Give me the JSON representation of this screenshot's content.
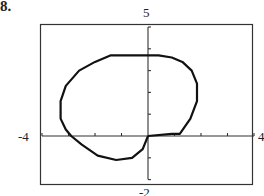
{
  "problem": {
    "number": "8."
  },
  "chart_data": {
    "type": "line",
    "title": "",
    "xlabel": "",
    "ylabel": "",
    "xlim": [
      -4,
      4
    ],
    "ylim": [
      -2,
      5
    ],
    "x_tick_step": 1,
    "y_tick_step": 1,
    "grid": false,
    "legend": null,
    "window_labels": {
      "xmin": "-4",
      "xmax": "4",
      "ymin": "-2",
      "ymax": "5"
    },
    "series": [
      {
        "name": "closed curve (polar graph, cusp near origin)",
        "x": [
          0,
          0.9,
          1.2,
          1.6,
          1.85,
          1.85,
          1.65,
          1.3,
          0.9,
          0.4,
          0,
          -0.5,
          -1.4,
          -2.0,
          -2.6,
          -3.1,
          -3.3,
          -3.3,
          -3.1,
          -2.9,
          -2.5,
          -1.9,
          -1.2,
          -0.6,
          -0.2,
          0
        ],
        "y": [
          0,
          0.1,
          0.1,
          0.8,
          1.6,
          2.4,
          3.0,
          3.4,
          3.6,
          3.7,
          3.7,
          3.7,
          3.7,
          3.4,
          3.0,
          2.3,
          1.6,
          0.8,
          0.3,
          0,
          -0.4,
          -0.9,
          -1.1,
          -1.0,
          -0.6,
          0
        ],
        "color": "#111111"
      }
    ]
  },
  "colors": {
    "curve": "#111111",
    "frame": "#333333",
    "axis": "#333333",
    "background": "#ffffff"
  }
}
